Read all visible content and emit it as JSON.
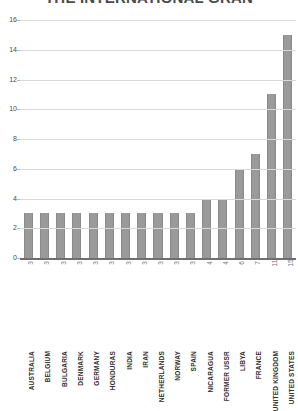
{
  "chart_data": {
    "type": "bar",
    "title": "THE INTERNATIONAL GRAN",
    "xlabel": "",
    "ylabel": "",
    "ylim": [
      0,
      16
    ],
    "yticks": [
      0,
      2,
      4,
      6,
      8,
      10,
      12,
      14,
      16
    ],
    "grid": true,
    "legend": false,
    "bar_color": "#9a9a9a",
    "categories": [
      "AUSTRALIA",
      "BELGIUM",
      "BULGARIA",
      "DENMARK",
      "GERMANY",
      "HONDURAS",
      "INDIA",
      "IRAN",
      "NETHERLANDS",
      "NORWAY",
      "SPAIN",
      "NICARAGUA",
      "FORMER USSR",
      "LIBYA",
      "FRANCE",
      "UNITED KINGDOM",
      "UNITED STATES"
    ],
    "values": [
      3,
      3,
      3,
      3,
      3,
      3,
      3,
      3,
      3,
      3,
      3,
      4,
      4,
      6,
      7,
      11,
      15
    ],
    "value_labels": [
      "3",
      "3",
      "3",
      "3",
      "3",
      "3",
      "3",
      "3",
      "3",
      "3",
      "3",
      "4",
      "4",
      "6",
      "7",
      "11",
      "15"
    ]
  }
}
